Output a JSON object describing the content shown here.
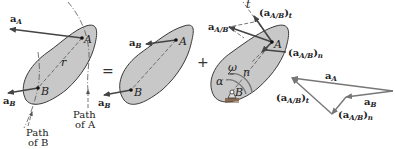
{
  "figure": {
    "operators": {
      "equals": "=",
      "plus": "+"
    },
    "panel1": {
      "point_a": "A",
      "point_b": "B",
      "radius": "r",
      "vec_a": "a",
      "vec_a_sub": "A",
      "vec_b": "a",
      "vec_b_sub": "B",
      "path_b_line1": "Path",
      "path_b_line2": "of B",
      "path_a_line1": "Path",
      "path_a_line2": "of A"
    },
    "panel2": {
      "point_a": "A",
      "point_b": "B",
      "vec_b_top": "a",
      "vec_b_top_sub": "B",
      "vec_b": "a",
      "vec_b_sub": "B"
    },
    "panel3": {
      "point_a": "A",
      "point_b": "B",
      "t_axis": "t",
      "n_axis": "n",
      "omega": "ω",
      "alpha": "α",
      "rel": "a",
      "rel_sub": "A/B",
      "tangential": "(a",
      "tangential_sub": "A/B",
      "tangential_close": ")",
      "tangential_t": "t",
      "normal": "(a",
      "normal_sub": "A/B",
      "normal_close": ")",
      "normal_n": "n"
    },
    "polygon": {
      "a_A": "a",
      "a_A_sub": "A",
      "a_B": "a",
      "a_B_sub": "B",
      "t_label": "(a",
      "t_label_sub": "A/B",
      "t_label_close": ")",
      "t_label_t": "t",
      "n_label": "(a",
      "n_label_sub": "A/B",
      "n_label_close": ")",
      "n_label_n": "n"
    }
  }
}
